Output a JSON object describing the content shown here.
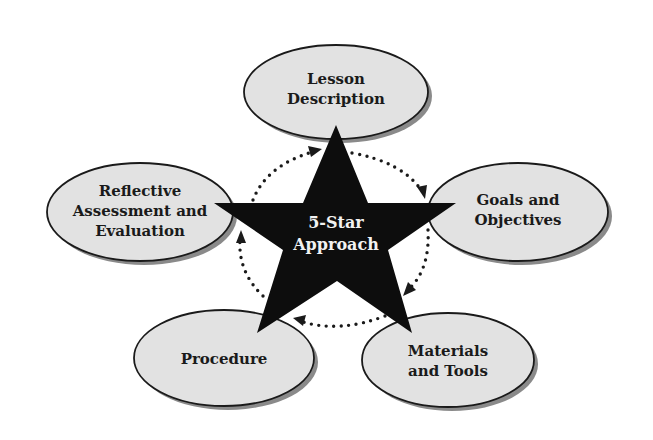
{
  "diagram": {
    "center": {
      "lines": [
        "5-Star",
        "Approach"
      ]
    },
    "nodes": [
      {
        "id": "lesson-description",
        "lines": [
          "Lesson",
          "Description"
        ]
      },
      {
        "id": "goals-and-objectives",
        "lines": [
          "Goals and",
          "Objectives"
        ]
      },
      {
        "id": "materials-and-tools",
        "lines": [
          "Materials",
          "and Tools"
        ]
      },
      {
        "id": "procedure",
        "lines": [
          "Procedure"
        ]
      },
      {
        "id": "reflective-assessment",
        "lines": [
          "Reflective",
          "Assessment and",
          "Evaluation"
        ]
      }
    ],
    "colors": {
      "node_fill": "#e2e2e2",
      "node_stroke": "#1a1a1a",
      "star_fill": "#0d0d0d",
      "shadow": "#8a8a8a"
    }
  }
}
